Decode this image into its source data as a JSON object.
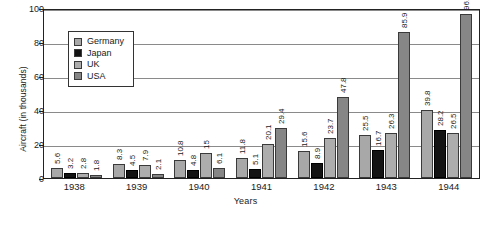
{
  "chart_data": {
    "type": "bar",
    "title": "",
    "xlabel": "Years",
    "ylabel": "Aircraft (in thousands)",
    "categories": [
      "1938",
      "1939",
      "1940",
      "1941",
      "1942",
      "1943",
      "1944"
    ],
    "ylim": [
      0,
      100
    ],
    "yticks": [
      "0",
      "20",
      "40",
      "60",
      "80",
      "100"
    ],
    "grid": true,
    "legend_position": "upper-left-inside",
    "series": [
      {
        "name": "Germany",
        "color": "#a8a8a8",
        "values": [
          5.6,
          8.3,
          10.8,
          11.8,
          15.6,
          25.5,
          39.8
        ],
        "labels": [
          "5.6",
          "8.3",
          "10.8",
          "11.8",
          "15.6",
          "25.5",
          "39.8"
        ]
      },
      {
        "name": "Japan",
        "color": "#131313",
        "values": [
          3.2,
          4.5,
          4.8,
          5.1,
          8.9,
          16.7,
          28.2
        ],
        "labels": [
          "3.2",
          "4.5",
          "4.8",
          "5.1",
          "8.9",
          "16.7",
          "28.2"
        ]
      },
      {
        "name": "UK",
        "color": "#adadad",
        "values": [
          2.8,
          7.9,
          15,
          20.1,
          23.7,
          26.3,
          26.5
        ],
        "labels": [
          "2.8",
          "7.9",
          "15",
          "20.1",
          "23.7",
          "26.3",
          "26.5"
        ]
      },
      {
        "name": "USA",
        "color": "#868686",
        "values": [
          1.8,
          2.1,
          6.1,
          29.4,
          47.8,
          85.9,
          96.3
        ],
        "labels": [
          "1.8",
          "2.1",
          "6.1",
          "29.4",
          "47.8",
          "85.9",
          "96.3"
        ]
      }
    ]
  }
}
